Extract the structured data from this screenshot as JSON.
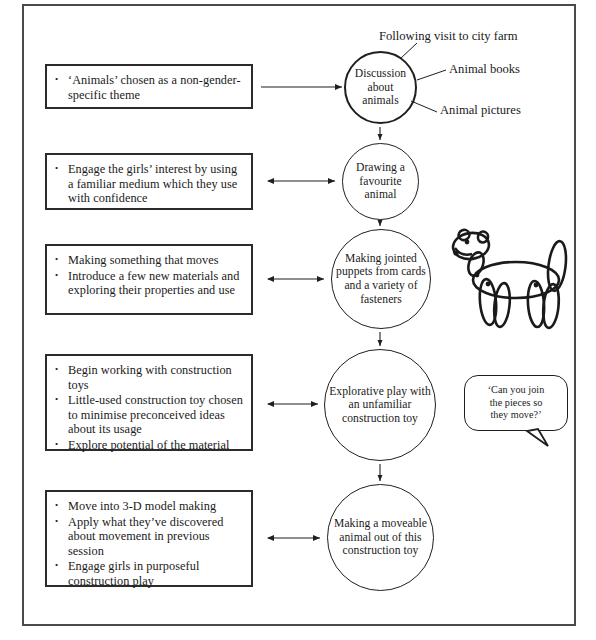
{
  "diagram": {
    "frame_color": "#4a4a4a",
    "ink_color": "#1f1f1f",
    "rows": [
      {
        "id": "row-1",
        "bullets": [
          "‘Animals’ chosen as a",
          "non-gender-specific theme"
        ],
        "bullet_items": [
          "‘Animals’ chosen as a non-gender-specific theme"
        ],
        "circle_text": "Discussion about animals"
      },
      {
        "id": "row-2",
        "bullet_items": [
          "Engage the girls’ interest by using a familiar medium which they use with confidence"
        ],
        "circle_text": "Drawing a favourite animal"
      },
      {
        "id": "row-3",
        "bullet_items": [
          "Making something that moves",
          "Introduce a few new materials and exploring their properties and use"
        ],
        "circle_text": "Making jointed puppets from cards and a variety of fasteners"
      },
      {
        "id": "row-4",
        "bullet_items": [
          "Begin working with construction toys",
          "Little-used construction toy chosen to minimise preconceived ideas about its usage",
          "Explore potential of the material"
        ],
        "circle_text": "Explorative play with an unfamiliar construction toy"
      },
      {
        "id": "row-5",
        "bullet_items": [
          "Move into 3-D model making",
          "Apply what they’ve discovered about movement in previous session",
          "Engage girls in purposeful construction play"
        ],
        "circle_text": "Making a moveable animal out of this construction toy"
      }
    ],
    "annotations": [
      {
        "id": "annot-city-farm",
        "label": "Following visit to city farm"
      },
      {
        "id": "annot-animal-books",
        "label": "Animal books"
      },
      {
        "id": "annot-animal-pictures",
        "label": "Animal pictures"
      }
    ],
    "speech_bubble": {
      "id": "speech-bubble-join-pieces",
      "lines": [
        "‘Can you join",
        "the pieces so",
        "they move?’"
      ],
      "text": "‘Can you join the pieces so they move?’"
    },
    "illustration": {
      "id": "jointed-dog-puppet",
      "label": "jointed dog puppet drawing"
    }
  }
}
